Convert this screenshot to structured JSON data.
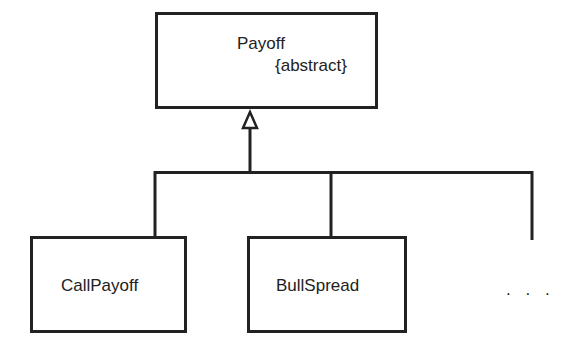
{
  "diagram": {
    "type": "uml-class-hierarchy",
    "colors": {
      "stroke": "#222222",
      "background": "#ffffff",
      "text": "#222222"
    },
    "base_class": {
      "name": "Payoff",
      "stereotype": "{abstract}"
    },
    "subclasses": [
      {
        "name": "CallPayoff"
      },
      {
        "name": "BullSpread"
      }
    ],
    "more_indicator": ". . .",
    "relationship": "generalization"
  }
}
